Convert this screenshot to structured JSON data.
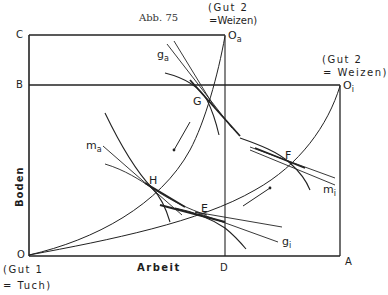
{
  "figure": {
    "caption": "Abb. 75",
    "corner_labels": {
      "C": "C",
      "B": "B",
      "O": "O",
      "D": "D",
      "A": "A"
    },
    "origins": {
      "o_a": {
        "main": "O",
        "sub": "a"
      },
      "o_i": {
        "main": "O",
        "sub": "i"
      }
    },
    "good_labels": {
      "gut2_a_line1": "(Gut 2",
      "gut2_a_line2": "=Weizen)",
      "gut2_i_line1": "(Gut 2",
      "gut2_i_line2": "= Weizen)",
      "gut1_line1": "(Gut 1",
      "gut1_line2": "= Tuch)"
    },
    "axis_labels": {
      "x": "Arbeit",
      "y": "Boden"
    },
    "points": {
      "G": "G",
      "H": "H",
      "E": "E",
      "F": "F"
    },
    "curve_labels": {
      "g_a": {
        "main": "g",
        "sub": "a"
      },
      "m_a": {
        "main": "m",
        "sub": "a"
      },
      "m_i": {
        "main": "m",
        "sub": "i"
      },
      "g_i": {
        "main": "g",
        "sub": "i"
      }
    },
    "colors": {
      "ink": "#222222",
      "background": "#ffffff"
    }
  }
}
